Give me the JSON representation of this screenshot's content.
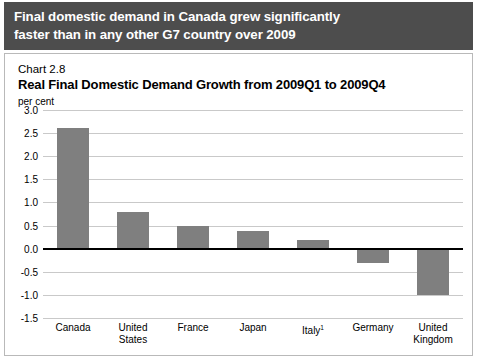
{
  "banner": {
    "line1": "Final domestic demand in Canada grew significantly",
    "line2": "faster than in any other G7 country over 2009",
    "background_color": "#4d4d4d",
    "text_color": "#ffffff"
  },
  "chart_label": "Chart 2.8",
  "chart_title": "Real Final Domestic Demand Growth from 2009Q1 to 2009Q4",
  "axis_unit": "per cent",
  "colors": {
    "bar": "#7f7f7f",
    "gridline": "#c9c9c9",
    "zeroline": "#000000",
    "panel_border": "#b9b9b9"
  },
  "chart_data": {
    "type": "bar",
    "title": "Real Final Domestic Demand Growth from 2009Q1 to 2009Q4",
    "subtitle": "Chart 2.8",
    "xlabel": "",
    "ylabel": "per cent",
    "ylim": [
      -1.5,
      3.0
    ],
    "ytick_step": 0.5,
    "yticks": [
      "3.0",
      "2.5",
      "2.0",
      "1.5",
      "1.0",
      "0.5",
      "0.0",
      "-0.5",
      "-1.0",
      "-1.5"
    ],
    "ytick_values": [
      3.0,
      2.5,
      2.0,
      1.5,
      1.0,
      0.5,
      0.0,
      -0.5,
      -1.0,
      -1.5
    ],
    "grid": true,
    "legend": false,
    "categories": [
      "Canada",
      "United States",
      "France",
      "Japan",
      "Italy",
      "Germany",
      "United Kingdom"
    ],
    "category_labels": [
      {
        "line1": "Canada",
        "line2": "",
        "footnote": ""
      },
      {
        "line1": "United",
        "line2": "States",
        "footnote": ""
      },
      {
        "line1": "France",
        "line2": "",
        "footnote": ""
      },
      {
        "line1": "Japan",
        "line2": "",
        "footnote": ""
      },
      {
        "line1": "Italy",
        "line2": "",
        "footnote": "1"
      },
      {
        "line1": "Germany",
        "line2": "",
        "footnote": ""
      },
      {
        "line1": "United",
        "line2": "Kingdom",
        "footnote": ""
      }
    ],
    "values": [
      2.6,
      0.8,
      0.5,
      0.38,
      0.18,
      -0.3,
      -1.0
    ]
  }
}
